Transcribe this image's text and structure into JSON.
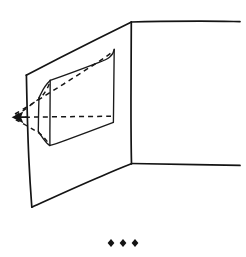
{
  "figure": {
    "title": "Perspective drawing of a wall corner with a recessed window opening",
    "caption": "",
    "background_color": "#ffffff",
    "ink_color": "#141414",
    "width": 246,
    "height": 257,
    "style": "hand-drawn line art, black ink on white"
  },
  "elements": {
    "left_wall": {
      "name": "left wall plane",
      "description": "large parallelogram receding to the left",
      "points": "131,22 26,75 32,207 131,163",
      "corners": {
        "top_right": [
          131,
          22
        ],
        "top_left": [
          26,
          75
        ],
        "bottom_left": [
          32,
          207
        ],
        "bottom_right": [
          131,
          163
        ]
      }
    },
    "corner_edge": {
      "name": "vertical corner edge",
      "description": "shared vertical edge where the two walls meet",
      "points": "131,22 131,163"
    },
    "right_wall": {
      "name": "right wall plane",
      "description": "frontal wall running off the right side of the frame",
      "top_edge": "131,22 239,21",
      "bottom_edge": "131,163 239,165"
    },
    "window_opening": {
      "name": "recessed window reveal",
      "description": "rectangular opening cut into the left wall showing its inner reveal faces",
      "outer_face": "114,49 113,122 50,145 50,80",
      "near_jamb_top": [
        50,
        80
      ],
      "near_jamb_bottom": [
        50,
        145
      ],
      "far_top_right": [
        114,
        49
      ],
      "far_bottom_right": [
        113,
        122
      ],
      "reveal_top_left": [
        40,
        97
      ],
      "reveal_bottom_left": [
        38,
        131
      ]
    },
    "sight_lines": {
      "name": "dashed projection lines",
      "description": "dashed construction lines converging at the arrow point",
      "convergence_point": [
        13,
        117
      ],
      "count": 4
    },
    "arrow": {
      "name": "vanishing-point arrow",
      "description": "solid arrowhead pointing left at the convergence of the dashed lines",
      "tip": [
        12,
        117
      ],
      "direction": "left"
    },
    "dot_row": {
      "name": "three diamond dots",
      "description": "row of three small diamond glyphs beneath the drawing",
      "count": 3,
      "positions": [
        [
          111,
          243
        ],
        [
          123,
          243
        ],
        [
          135,
          243
        ]
      ],
      "glyph": "diamond-dot"
    }
  },
  "labels": {
    "none_present": ""
  }
}
